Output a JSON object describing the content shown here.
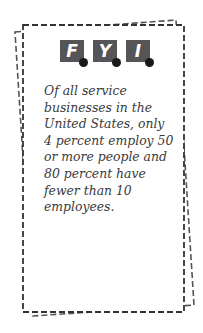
{
  "card": {
    "logo_letters": [
      "F",
      "Y",
      "I"
    ],
    "fact_text": "Of all service businesses in the United States, only 4 percent employ 50 or more people and 80 percent have fewer than 10 employees."
  },
  "colors": {
    "tile": "#555457",
    "dot": "#1a1a1a",
    "border": "#333333",
    "text": "#3a3a3a"
  }
}
